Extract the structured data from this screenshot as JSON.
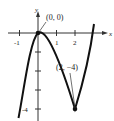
{
  "graph": {
    "function": "f(x) = x^3 - 3x^2",
    "x_axis_label": "x",
    "y_axis_label": "y",
    "x_ticks": [
      {
        "value": -1,
        "label": "-1"
      },
      {
        "value": 1,
        "label": "1"
      },
      {
        "value": 2,
        "label": "2"
      }
    ],
    "y_ticks": [
      {
        "value": -1,
        "label": ""
      },
      {
        "value": -2,
        "label": ""
      },
      {
        "value": -3,
        "label": ""
      },
      {
        "value": -4,
        "label": "-4"
      }
    ],
    "points": [
      {
        "x": 0,
        "y": 0,
        "label": "(0, 0)"
      },
      {
        "x": 2,
        "y": -4,
        "label": "(2, −4)"
      }
    ],
    "curve_color": "#111111",
    "axis_color": "#333333"
  }
}
